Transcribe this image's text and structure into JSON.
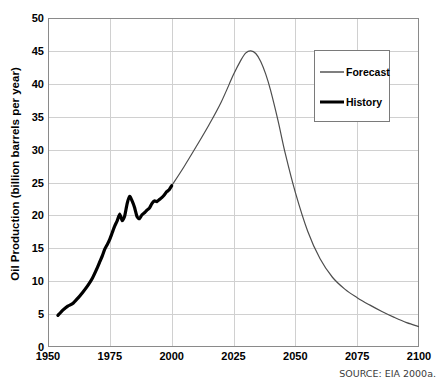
{
  "chart_data": {
    "type": "line",
    "title": "",
    "xlabel": "",
    "ylabel": "Oil Production (billion barrels per year)",
    "xlim": [
      1950,
      2100
    ],
    "ylim": [
      0,
      50
    ],
    "xticks": [
      1950,
      1975,
      2000,
      2025,
      2050,
      2075,
      2100
    ],
    "yticks": [
      0,
      5,
      10,
      15,
      20,
      25,
      30,
      35,
      40,
      45,
      50
    ],
    "grid": true,
    "legend_position": "upper right",
    "source_note": "SOURCE: EIA 2000a.",
    "series": [
      {
        "name": "History",
        "style": "thick-solid",
        "color": "#000000",
        "x": [
          1954,
          1956,
          1958,
          1960,
          1962,
          1964,
          1966,
          1968,
          1970,
          1971,
          1972,
          1973,
          1974,
          1975,
          1976,
          1977,
          1978,
          1979,
          1980,
          1981,
          1982,
          1983,
          1984,
          1985,
          1986,
          1987,
          1988,
          1989,
          1990,
          1991,
          1992,
          1993,
          1994,
          1995,
          1996,
          1997,
          1998,
          1999,
          2000
        ],
        "values": [
          4.8,
          5.6,
          6.2,
          6.6,
          7.4,
          8.3,
          9.3,
          10.5,
          12.1,
          13.0,
          13.9,
          14.9,
          15.6,
          16.4,
          17.4,
          18.4,
          19.2,
          20.2,
          19.2,
          19.9,
          21.8,
          22.9,
          22.2,
          21.2,
          19.8,
          19.5,
          20.1,
          20.4,
          20.8,
          21.1,
          21.8,
          22.2,
          22.1,
          22.4,
          22.7,
          23.1,
          23.6,
          23.9,
          24.5
        ]
      },
      {
        "name": "Forecast",
        "style": "thin-solid",
        "color": "#4d4d4d",
        "x": [
          2000,
          2005,
          2010,
          2015,
          2020,
          2025,
          2028,
          2030,
          2032,
          2034,
          2036,
          2038,
          2040,
          2043,
          2046,
          2050,
          2055,
          2060,
          2065,
          2070,
          2075,
          2080,
          2085,
          2090,
          2095,
          2100
        ],
        "values": [
          24.5,
          27.4,
          30.5,
          33.7,
          37.2,
          41.4,
          43.6,
          44.7,
          45.0,
          44.6,
          43.4,
          41.5,
          39.0,
          34.4,
          29.3,
          23.5,
          17.6,
          13.4,
          10.6,
          8.8,
          7.5,
          6.4,
          5.4,
          4.5,
          3.7,
          3.1
        ]
      }
    ],
    "annotations": {
      "peak_value": 45.0,
      "peak_year": 2032,
      "history_start_year": 1954,
      "history_start_value": 4.8,
      "history_end_year": 2000,
      "history_end_value": 24.5,
      "end_year": 2100,
      "end_value": 3.1
    }
  },
  "legend": {
    "items": [
      {
        "label": "Forecast"
      },
      {
        "label": "History"
      }
    ]
  },
  "axis": {
    "y_title": "Oil Production (billion barrels per year)"
  },
  "colors": {
    "history_line": "#000000",
    "forecast_line": "#4d4d4d",
    "grid": "#d0d0d0",
    "axis": "#8a8a8a",
    "text": "#000000",
    "source_text": "#3b3b3b",
    "background": "#ffffff"
  }
}
